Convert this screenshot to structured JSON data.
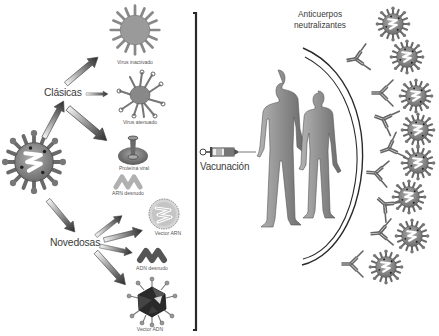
{
  "diagram": {
    "colors": {
      "background": "#ffffff",
      "line": "#2a2a2a",
      "virus_fill": "#8c8c8c",
      "figure_fill": "#8a8a8a",
      "text": "#3a3a3a"
    },
    "source_virus": {
      "label": "",
      "icon": "coronavirus-icon"
    },
    "branches": [
      {
        "label": "Clásicas",
        "items": [
          {
            "label": "Virus inactivado",
            "icon": "inactivated-virus-icon"
          },
          {
            "label": "Virus atenuado",
            "icon": "attenuated-virus-icon"
          },
          {
            "label": "Proteína viral",
            "icon": "viral-protein-icon"
          }
        ]
      },
      {
        "label": "Novedosas",
        "items": [
          {
            "label": "ARN desnudo",
            "icon": "naked-rna-icon"
          },
          {
            "label": "Vector ARN",
            "icon": "rna-vector-icon"
          },
          {
            "label": "ADN desnudo",
            "icon": "naked-dna-icon"
          },
          {
            "label": "Vector ADN",
            "icon": "dna-vector-icon"
          }
        ]
      }
    ],
    "vaccination": {
      "label": "Vacunación",
      "icon": "syringe-icon"
    },
    "people": {
      "icon": "human-couple-icon"
    },
    "antibodies": {
      "label_line1": "Anticuerpos",
      "label_line2": "neutralizantes",
      "count": 9,
      "icon": "antibody-icon"
    },
    "pathogens": {
      "count": 8,
      "icon": "coronavirus-icon"
    }
  }
}
